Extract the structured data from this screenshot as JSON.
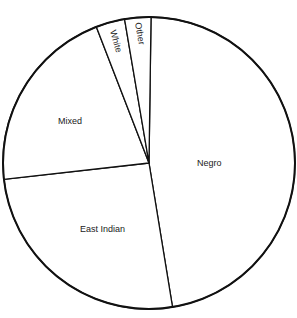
{
  "chart_data": {
    "type": "pie",
    "title": "",
    "start_angle_deg": 0.8,
    "direction": "clockwise",
    "slices": [
      {
        "label": "Negro",
        "value": 47.2
      },
      {
        "label": "East Indian",
        "value": 25.8
      },
      {
        "label": "Mixed",
        "value": 20.9
      },
      {
        "label": "White",
        "value": 3.2
      },
      {
        "label": "Other",
        "value": 2.9
      }
    ],
    "legend": "none",
    "labels_inside": true,
    "fill": "#ffffff",
    "stroke": "#111111"
  },
  "labels": {
    "negro": "Negro",
    "east_indian": "East Indian",
    "mixed": "Mixed",
    "white": "White",
    "other": "Other"
  }
}
